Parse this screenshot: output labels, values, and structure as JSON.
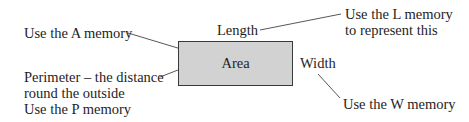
{
  "diagram": {
    "shape": {
      "label": "Area",
      "fill": "#d2d2d2",
      "stroke": "#3a3a3a"
    },
    "labels": {
      "length": "Length",
      "width": "Width",
      "a_memory": "Use the A memory",
      "perimeter": [
        "Perimeter – the distance",
        "round the outside",
        "Use the P memory"
      ],
      "l_memory": [
        "Use the L memory",
        "to represent this"
      ],
      "w_memory": "Use the W memory"
    },
    "line_color": "#444444"
  }
}
